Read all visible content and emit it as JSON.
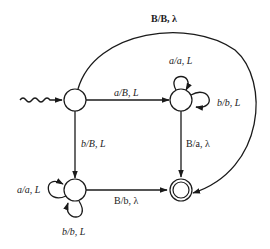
{
  "diagram": {
    "type": "state-transition-diagram (Turing machine)",
    "colors": {
      "stroke": "#1a1a1a",
      "background": "#ffffff",
      "text": "#222222"
    },
    "states": [
      {
        "id": "q0",
        "role": "initial",
        "cx": 75,
        "cy": 100
      },
      {
        "id": "q1",
        "role": "normal",
        "cx": 181,
        "cy": 100
      },
      {
        "id": "q2",
        "role": "normal",
        "cx": 75,
        "cy": 190
      },
      {
        "id": "q3",
        "role": "final",
        "cx": 181,
        "cy": 190
      }
    ],
    "transitions": [
      {
        "from": "q0",
        "to": "q3",
        "label": "B/B, λ"
      },
      {
        "from": "q0",
        "to": "q1",
        "label": "a/B, L"
      },
      {
        "from": "q0",
        "to": "q2",
        "label": "b/B, L"
      },
      {
        "from": "q1",
        "to": "q1",
        "label": "a/a, L"
      },
      {
        "from": "q1",
        "to": "q1",
        "label": "b/b, L"
      },
      {
        "from": "q1",
        "to": "q3",
        "label": "B/a, λ"
      },
      {
        "from": "q2",
        "to": "q2",
        "label": "a/a, L"
      },
      {
        "from": "q2",
        "to": "q2",
        "label": "b/b, L"
      },
      {
        "from": "q2",
        "to": "q3",
        "label": "B/b, λ"
      }
    ],
    "labels": {
      "arc_top": "B/B, λ",
      "q0_q1": "a/B, L",
      "q0_q2": "b/B, L",
      "q1_loop_top": "a/a, L",
      "q1_loop_right": "b/b, L",
      "q1_q3": "B/a, λ",
      "q2_loop_left": "a/a, L",
      "q2_loop_bottom": "b/b, L",
      "q2_q3": "B/b, λ"
    }
  }
}
